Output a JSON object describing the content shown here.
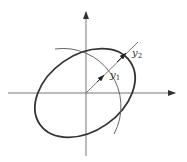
{
  "diagram": {
    "type": "coordinate-ellipse",
    "axes": {
      "horizontal": {
        "has_arrow": true
      },
      "vertical": {
        "has_arrow": true
      }
    },
    "labels": {
      "y1": {
        "base": "y",
        "sub": "1"
      },
      "y2": {
        "base": "y",
        "sub": "2"
      }
    },
    "colors": {
      "ellipse": "#333333",
      "axis": "#666666",
      "arc": "#555555",
      "ray": "#666666"
    },
    "elements": [
      "tilted-ellipse",
      "circular-arc",
      "diagonal-ray",
      "arrow-to-arc-y1",
      "arrow-to-ellipse-y2"
    ]
  }
}
